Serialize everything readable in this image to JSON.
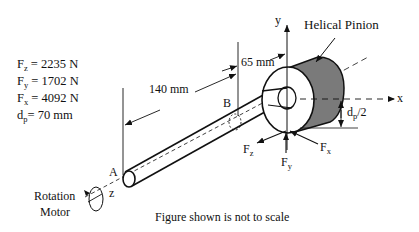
{
  "given": {
    "items": [
      {
        "symbol": "F",
        "sub": "z",
        "value": " = 2235 N"
      },
      {
        "symbol": "F",
        "sub": "y",
        "value": " = 1702 N"
      },
      {
        "symbol": "F",
        "sub": "x",
        "value": " = 4092 N"
      },
      {
        "symbol": "d",
        "sub": "p",
        "value": "= 70 mm"
      }
    ]
  },
  "labels": {
    "pinion": "Helical Pinion",
    "dim_140": "140 mm",
    "dim_65": "65 mm",
    "point_a": "A",
    "point_b": "B",
    "axis_x": "x",
    "axis_y": "y",
    "axis_z": "z",
    "radius_d": "d",
    "radius_sub": "p",
    "radius_tail": "/2",
    "force_z": "F",
    "force_z_sub": "z",
    "force_y": "F",
    "force_y_sub": "y",
    "force_x": "F",
    "force_x_sub": "x",
    "motor_line1": "Rotation",
    "motor_line2": "Motor",
    "caption": "Figure shown is not to scale"
  },
  "colors": {
    "pinion_face": "#7a7a7a",
    "line": "#111111"
  }
}
